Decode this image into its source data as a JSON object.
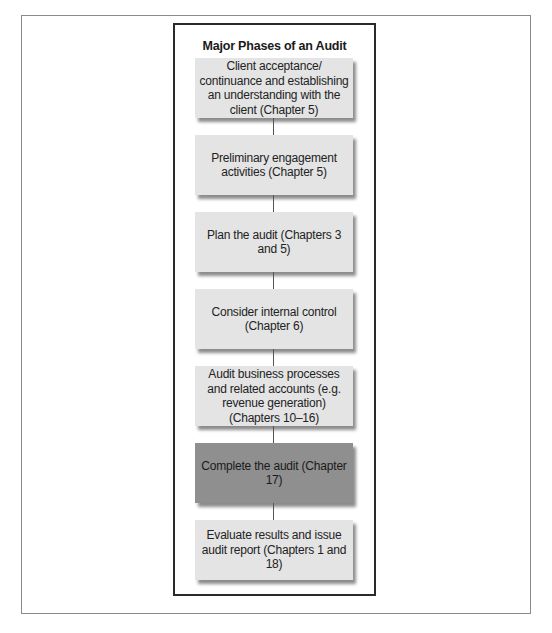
{
  "diagram": {
    "title": "Major Phases of an Audit",
    "phases": [
      {
        "label": "Client acceptance/ continuance and establishing an understanding with the client (Chapter 5)",
        "highlighted": false
      },
      {
        "label": "Preliminary engagement activities (Chapter 5)",
        "highlighted": false
      },
      {
        "label": "Plan the audit (Chapters 3 and 5)",
        "highlighted": false
      },
      {
        "label": "Consider internal control (Chapter 6)",
        "highlighted": false
      },
      {
        "label": "Audit business processes and related accounts (e.g. revenue generation) (Chapters 10–16)",
        "highlighted": false
      },
      {
        "label": "Complete the audit (Chapter 17)",
        "highlighted": true
      },
      {
        "label": "Evaluate results and issue audit report (Chapters 1 and 18)",
        "highlighted": false
      }
    ],
    "colors": {
      "box": "#e4e4e4",
      "highlight_box": "#8f8f8f",
      "border": "#2a2a2a"
    }
  }
}
